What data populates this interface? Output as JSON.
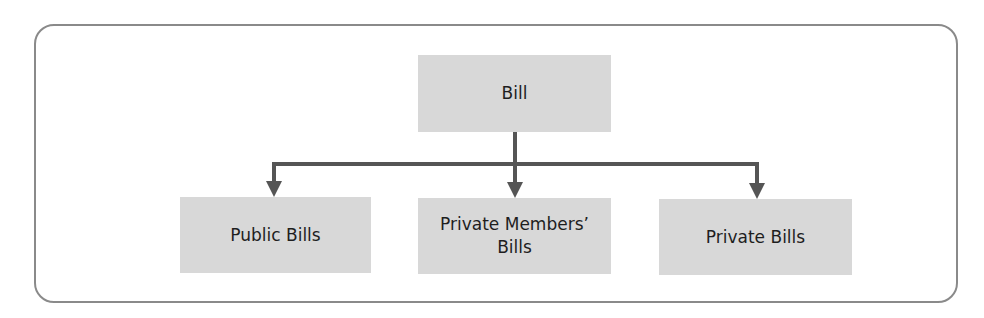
{
  "diagram": {
    "type": "hierarchy-tree",
    "root": {
      "label": "Bill"
    },
    "children": [
      {
        "label": "Public Bills"
      },
      {
        "label": "Private Members’\nBills"
      },
      {
        "label": "Private Bills"
      }
    ],
    "colors": {
      "node_fill": "#d8d8d8",
      "connector": "#555555",
      "frame_border": "#8a8a8a",
      "text": "#1e1e1e"
    }
  }
}
